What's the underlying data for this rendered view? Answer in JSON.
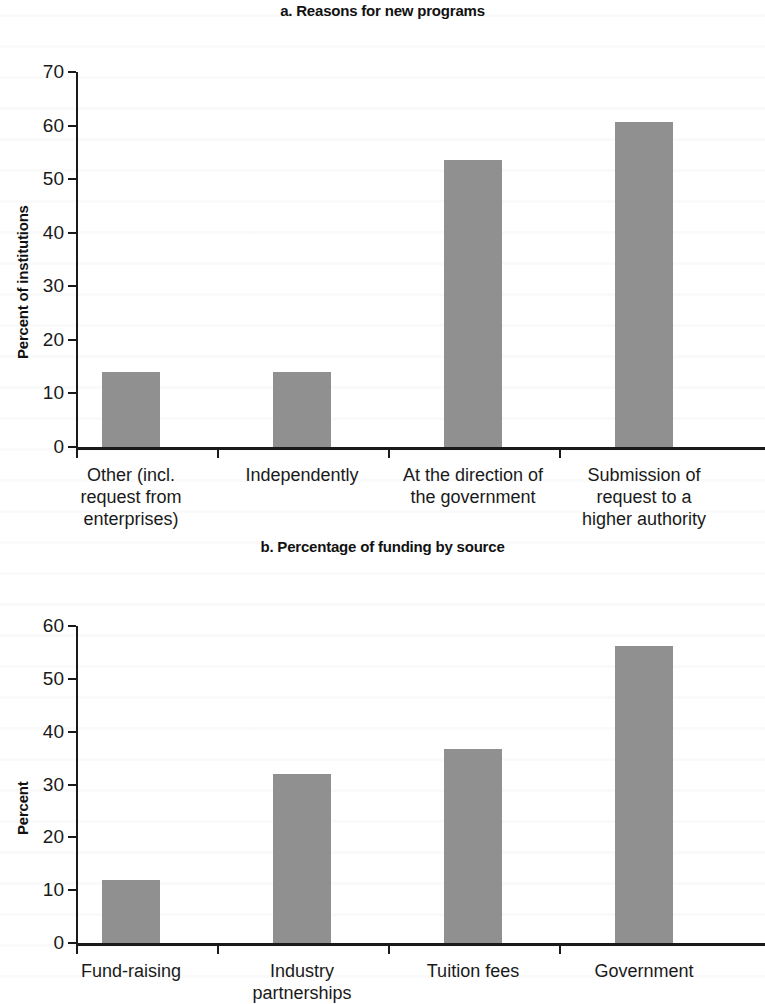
{
  "page": {
    "width": 765,
    "height": 989,
    "background": "#ffffff",
    "bar_color": "#909090",
    "axis_color": "#1a1a1a"
  },
  "chart_data": [
    {
      "id": "chart-a",
      "type": "bar",
      "title": "a. Reasons for new programs",
      "xlabel": "",
      "ylabel": "Percent of institutions",
      "ylim": [
        0,
        70
      ],
      "yticks": [
        0,
        10,
        20,
        30,
        40,
        50,
        60,
        70
      ],
      "ytick_labels": [
        "0",
        "10",
        "20",
        "30",
        "40",
        "50",
        "60",
        "70"
      ],
      "grid": false,
      "legend": "none",
      "categories": [
        "Other (incl. request from enterprises)",
        "Independently",
        "At the direction of the government",
        "Submission of request to a higher authority"
      ],
      "category_lines": [
        [
          "Other (incl.",
          "request from",
          "enterprises)"
        ],
        [
          "Independently"
        ],
        [
          "At the direction of",
          "the government"
        ],
        [
          "Submission of",
          "request to a",
          "higher authority"
        ]
      ],
      "values": [
        14,
        14,
        53.6,
        60.7
      ],
      "bar_color": "#909090"
    },
    {
      "id": "chart-b",
      "type": "bar",
      "title": "b. Percentage of funding by source",
      "xlabel": "",
      "ylabel": "Percent",
      "ylim": [
        0,
        60
      ],
      "yticks": [
        0,
        10,
        20,
        30,
        40,
        50,
        60
      ],
      "ytick_labels": [
        "0",
        "10",
        "20",
        "30",
        "40",
        "50",
        "60"
      ],
      "grid": false,
      "legend": "none",
      "categories": [
        "Fund-raising",
        "Industry partnerships",
        "Tuition fees",
        "Government"
      ],
      "category_lines": [
        [
          "Fund-raising"
        ],
        [
          "Industry",
          "partnerships"
        ],
        [
          "Tuition fees"
        ],
        [
          "Government"
        ]
      ],
      "values": [
        12,
        32,
        36.8,
        56.2
      ],
      "bar_color": "#909090"
    }
  ]
}
